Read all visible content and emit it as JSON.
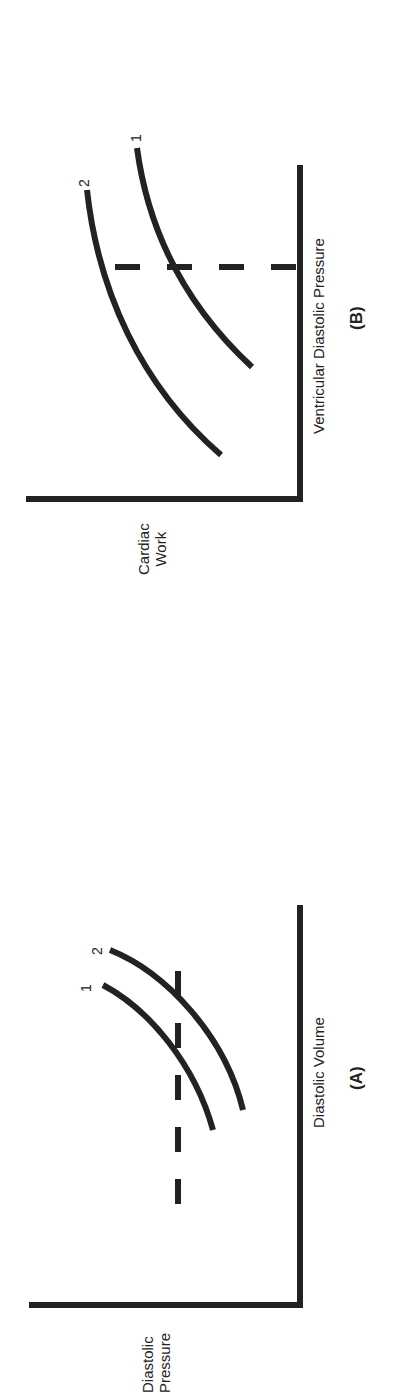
{
  "figure": {
    "orientation": "rotated 90 degrees counter-clockwise",
    "panels": [
      {
        "id": "(A)",
        "x_axis_label": "Diastolic Volume",
        "y_axis_label": "Diastolic Pressure",
        "curve_labels": [
          "1",
          "2"
        ],
        "reference_line": "horizontal dashed line at constant diastolic pressure"
      },
      {
        "id": "(B)",
        "x_axis_label": "Ventricular Diastolic Pressure",
        "y_axis_label": "Cardiac Work",
        "curve_labels": [
          "1",
          "2"
        ],
        "reference_line": "vertical dashed line at constant ventricular diastolic pressure"
      }
    ]
  },
  "panelA": {
    "title": "(A)",
    "xlabel": "Diastolic Volume",
    "ylabel_line1": "Diastolic",
    "ylabel_line2": "Pressure",
    "curve1": "1",
    "curve2": "2"
  },
  "panelB": {
    "title": "(B)",
    "xlabel": "Ventricular Diastolic Pressure",
    "ylabel_line1": "Cardiac",
    "ylabel_line2": "Work",
    "curve1": "1",
    "curve2": "2"
  },
  "colors": {
    "ink": "#222222",
    "background": "#ffffff"
  }
}
